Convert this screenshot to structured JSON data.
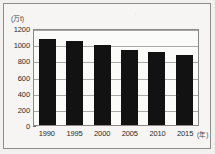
{
  "chart_data": {
    "type": "bar",
    "title": "",
    "subtitle": "",
    "xlabel": "(年)",
    "ylabel": "(万t)",
    "categories": [
      "1990",
      "1995",
      "2000",
      "2005",
      "2010",
      "2015"
    ],
    "values": [
      1060,
      1040,
      990,
      930,
      905,
      865
    ],
    "series": [
      {
        "name": "",
        "values": [
          1060,
          1040,
          990,
          930,
          905,
          865
        ]
      }
    ],
    "ylim": [
      0,
      1200
    ],
    "yticks": [
      "0",
      "200",
      "400",
      "600",
      "800",
      "1000",
      "1200"
    ],
    "ytick_values": [
      0,
      200,
      400,
      600,
      800,
      1000,
      1200
    ],
    "xticks": [
      "1990",
      "1995",
      "2000",
      "2005",
      "2010",
      "2015"
    ],
    "grid": true,
    "grid_axis": "y",
    "legend": false,
    "legend_position": "none",
    "bar_color": "#121212",
    "plot_background": "#fbfbfa",
    "frame_color": "#8a8987"
  },
  "figure": {
    "unit_y_label": "(万t)",
    "unit_x_label": "(年)",
    "caption": ""
  }
}
